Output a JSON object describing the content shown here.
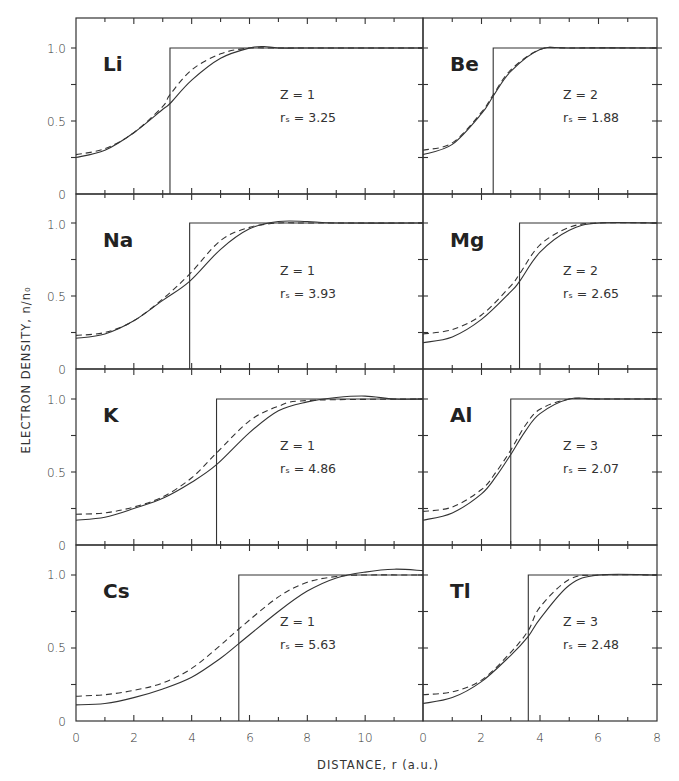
{
  "chart_data": {
    "type": "line",
    "title": "",
    "xlabel": "DISTANCE, r (a.u.)",
    "ylabel": "ELECTRON DENSITY, n/n0",
    "legend": [],
    "grid": false,
    "panels": [
      {
        "element": "Li",
        "Z": 1,
        "rs": 3.25,
        "xlim": [
          0,
          12
        ],
        "ylim": [
          0,
          1.2
        ],
        "step_at": 3.25,
        "solid": {
          "x": [
            0,
            1,
            2,
            3,
            3.25,
            4,
            5,
            6,
            6.5,
            7,
            8,
            9,
            12
          ],
          "y": [
            0.25,
            0.3,
            0.42,
            0.58,
            0.62,
            0.78,
            0.93,
            1.0,
            1.01,
            1.0,
            1.0,
            1.0,
            1.0
          ]
        },
        "dashed": {
          "x": [
            0,
            1,
            2,
            3,
            3.25,
            4,
            5,
            6,
            7,
            12
          ],
          "y": [
            0.27,
            0.31,
            0.42,
            0.6,
            0.68,
            0.85,
            0.96,
            1.0,
            1.0,
            1.0
          ]
        }
      },
      {
        "element": "Be",
        "Z": 2,
        "rs": 1.88,
        "xlim": [
          0,
          8
        ],
        "ylim": [
          0,
          1.2
        ],
        "step_at": 2.4,
        "solid": {
          "x": [
            0,
            1,
            2,
            2.4,
            3,
            4,
            5,
            8
          ],
          "y": [
            0.27,
            0.34,
            0.55,
            0.67,
            0.84,
            0.99,
            1.0,
            1.0
          ]
        },
        "dashed": {
          "x": [
            0,
            1,
            2,
            2.4,
            3,
            4,
            5,
            8
          ],
          "y": [
            0.3,
            0.35,
            0.56,
            0.68,
            0.85,
            0.99,
            1.0,
            1.0
          ]
        }
      },
      {
        "element": "Na",
        "Z": 1,
        "rs": 3.93,
        "xlim": [
          0,
          12
        ],
        "ylim": [
          0,
          1.2
        ],
        "step_at": 3.93,
        "solid": {
          "x": [
            0,
            1,
            2,
            3,
            3.93,
            5,
            6,
            7,
            8,
            9,
            12
          ],
          "y": [
            0.21,
            0.24,
            0.33,
            0.47,
            0.6,
            0.82,
            0.96,
            1.01,
            1.01,
            1.0,
            1.0
          ]
        },
        "dashed": {
          "x": [
            0,
            1,
            2,
            3,
            3.93,
            5,
            6,
            7,
            8,
            12
          ],
          "y": [
            0.23,
            0.25,
            0.33,
            0.48,
            0.65,
            0.88,
            0.97,
            1.0,
            1.0,
            1.0
          ]
        }
      },
      {
        "element": "Mg",
        "Z": 2,
        "rs": 2.65,
        "xlim": [
          0,
          8
        ],
        "ylim": [
          0,
          1.2
        ],
        "step_at": 3.3,
        "solid": {
          "x": [
            0,
            1,
            2,
            3,
            3.3,
            4,
            5,
            6,
            8
          ],
          "y": [
            0.18,
            0.22,
            0.34,
            0.53,
            0.6,
            0.8,
            0.95,
            1.0,
            1.0
          ]
        },
        "dashed": {
          "x": [
            0,
            1,
            2,
            3,
            3.3,
            4,
            5,
            6,
            8
          ],
          "y": [
            0.24,
            0.27,
            0.37,
            0.57,
            0.65,
            0.85,
            0.97,
            1.0,
            1.0
          ]
        }
      },
      {
        "element": "K",
        "Z": 1,
        "rs": 4.86,
        "xlim": [
          0,
          12
        ],
        "ylim": [
          0,
          1.2
        ],
        "step_at": 4.86,
        "solid": {
          "x": [
            0,
            1,
            2,
            3,
            4,
            4.86,
            6,
            7,
            8,
            9,
            10,
            11,
            12
          ],
          "y": [
            0.17,
            0.19,
            0.25,
            0.32,
            0.43,
            0.55,
            0.77,
            0.92,
            0.98,
            1.01,
            1.02,
            1.0,
            1.0
          ]
        },
        "dashed": {
          "x": [
            0,
            1,
            2,
            3,
            4,
            4.86,
            6,
            7,
            8,
            12
          ],
          "y": [
            0.21,
            0.22,
            0.26,
            0.33,
            0.46,
            0.63,
            0.85,
            0.95,
            0.99,
            1.0
          ]
        }
      },
      {
        "element": "Al",
        "Z": 3,
        "rs": 2.07,
        "xlim": [
          0,
          8
        ],
        "ylim": [
          0,
          1.2
        ],
        "step_at": 3.0,
        "solid": {
          "x": [
            0,
            1,
            2,
            2.5,
            3,
            3.5,
            4,
            5,
            6,
            8
          ],
          "y": [
            0.17,
            0.22,
            0.35,
            0.47,
            0.62,
            0.78,
            0.9,
            1.0,
            1.0,
            1.0
          ]
        },
        "dashed": {
          "x": [
            0,
            1,
            2,
            2.5,
            3,
            3.5,
            4,
            5,
            6,
            8
          ],
          "y": [
            0.23,
            0.26,
            0.38,
            0.5,
            0.65,
            0.82,
            0.93,
            1.0,
            1.0,
            1.0
          ]
        }
      },
      {
        "element": "Cs",
        "Z": 1,
        "rs": 5.63,
        "xlim": [
          0,
          12
        ],
        "ylim": [
          0,
          1.2
        ],
        "step_at": 5.63,
        "solid": {
          "x": [
            0,
            1,
            2,
            3,
            4,
            5,
            5.63,
            7,
            8,
            9,
            10,
            11,
            12
          ],
          "y": [
            0.11,
            0.12,
            0.16,
            0.22,
            0.3,
            0.43,
            0.53,
            0.75,
            0.89,
            0.98,
            1.02,
            1.04,
            1.03
          ]
        },
        "dashed": {
          "x": [
            0,
            1,
            2,
            3,
            4,
            5,
            5.63,
            7,
            8,
            9,
            10,
            12
          ],
          "y": [
            0.17,
            0.18,
            0.21,
            0.26,
            0.36,
            0.52,
            0.63,
            0.85,
            0.95,
            0.99,
            1.0,
            1.0
          ]
        }
      },
      {
        "element": "Tl",
        "Z": 3,
        "rs": 2.48,
        "xlim": [
          0,
          8
        ],
        "ylim": [
          0,
          1.2
        ],
        "step_at": 3.6,
        "solid": {
          "x": [
            0,
            1,
            2,
            3,
            3.6,
            4,
            5,
            6,
            8
          ],
          "y": [
            0.12,
            0.16,
            0.27,
            0.45,
            0.58,
            0.7,
            0.93,
            1.0,
            1.0
          ]
        },
        "dashed": {
          "x": [
            0,
            1,
            2,
            3,
            3.6,
            4,
            5,
            6,
            8
          ],
          "y": [
            0.18,
            0.2,
            0.28,
            0.47,
            0.62,
            0.78,
            0.97,
            1.0,
            1.0
          ]
        }
      }
    ],
    "x_ticks_left": [
      "0",
      "2",
      "4",
      "6",
      "8",
      "10"
    ],
    "x_ticks_right": [
      "0",
      "2",
      "4",
      "6",
      "8"
    ],
    "y_ticks": [
      "0",
      "0.5",
      "1.0"
    ]
  },
  "labels": {
    "ylabel": "ELECTRON DENSITY, n/n₀",
    "xlabel": "DISTANCE, r (a.u.)",
    "y0": "0",
    "y05": "0.5",
    "y1": "1.0",
    "z_prefix": "Z =",
    "rs_prefix": "rₛ =",
    "xl": [
      "0",
      "2",
      "4",
      "6",
      "8",
      "10",
      "0"
    ],
    "xr": [
      "2",
      "4",
      "6",
      "8"
    ]
  },
  "panels": [
    {
      "element": "Li",
      "z": "Z = 1",
      "rs": "rₛ = 3.25"
    },
    {
      "element": "Be",
      "z": "Z = 2",
      "rs": "rₛ = 1.88"
    },
    {
      "element": "Na",
      "z": "Z = 1",
      "rs": "rₛ = 3.93"
    },
    {
      "element": "Mg",
      "z": "Z = 2",
      "rs": "rₛ = 2.65"
    },
    {
      "element": "K",
      "z": "Z = 1",
      "rs": "rₛ = 4.86"
    },
    {
      "element": "Al",
      "z": "Z = 3",
      "rs": "rₛ = 2.07"
    },
    {
      "element": "Cs",
      "z": "Z = 1",
      "rs": "rₛ = 5.63"
    },
    {
      "element": "Tl",
      "z": "Z = 3",
      "rs": "rₛ = 2.48"
    }
  ]
}
